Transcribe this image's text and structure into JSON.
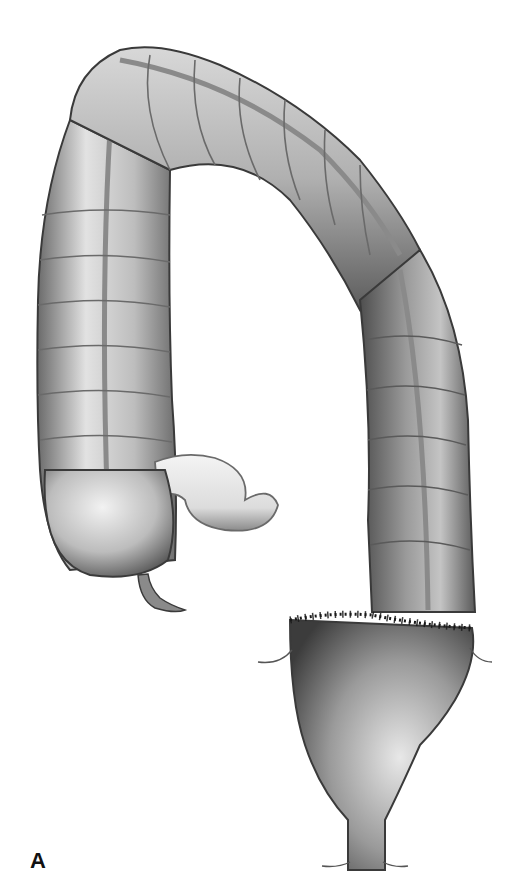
{
  "figure": {
    "panel_label": "A",
    "structures": [
      "ascending-colon",
      "cecum",
      "appendix",
      "terminal-ileum",
      "transverse-colon",
      "descending-colon",
      "staple-line",
      "rectum",
      "anal-canal"
    ],
    "colors": {
      "background": "#ffffff",
      "outline": "#3a3a3a",
      "shade-dark": "#4a4a4a",
      "shade-mid": "#8c8c8c",
      "highlight": "#e6e6e6",
      "staples": "#1a1a1a"
    }
  }
}
